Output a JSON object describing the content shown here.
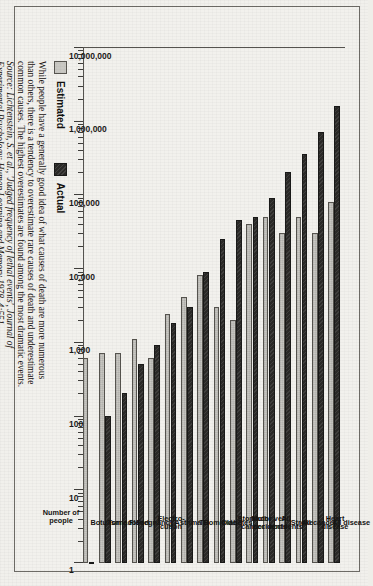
{
  "figure": {
    "legend": [
      {
        "key": "estimated",
        "label": "Estimated",
        "color": "#c9c8c3"
      },
      {
        "key": "actual",
        "label": "Actual",
        "color": "#2b2a28"
      }
    ],
    "axis_title": "Number of\npeople",
    "caption_body": "While people have a generally good idea of what causes of death are more numerous than others, there is a tendency to overestimate rare causes of death and underestimate common causes. The highest overestimates are found among the most dramatic events.",
    "caption_source": "Source: Lichtenstein, S. et al., 'Judged frequency of lethal events', Journal of Experimental Psychology: Human Learning and Memory 1978, 4:551"
  },
  "chart_data": {
    "type": "bar",
    "orientation": "horizontal",
    "title": "",
    "xlabel": "",
    "ylabel": "Number of people",
    "scale": "log10",
    "xlim": [
      1,
      10000000
    ],
    "grid": false,
    "legend_position": "bottom-left",
    "tick_labels": [
      "10,000,000",
      "1,000,000",
      "100,000",
      "10,000",
      "1,000",
      "100",
      "10",
      "1"
    ],
    "tick_values": [
      10000000,
      1000000,
      100000,
      10000,
      1000,
      100,
      10,
      1
    ],
    "categories": [
      "Botulism",
      "Tornado",
      "Flood",
      "Pregnancy",
      "Electro-\ncution",
      "Asthma",
      "TB",
      "Homicide",
      "Diabetes",
      "Stomach\ncancer",
      "Motor veh.\naccidents",
      "All\naccidents",
      "Stroke",
      "All cancer",
      "Heart\ndisease",
      "All disease"
    ],
    "series": [
      {
        "name": "Estimated",
        "values": [
          600,
          700,
          700,
          1100,
          600,
          2400,
          4000,
          8000,
          3000,
          2000,
          40000,
          50000,
          30000,
          50000,
          30000,
          80000
        ]
      },
      {
        "name": "Actual",
        "values": [
          1,
          100,
          200,
          500,
          900,
          1800,
          3000,
          9000,
          25000,
          45000,
          50000,
          90000,
          200000,
          350000,
          700000,
          1600000
        ]
      }
    ]
  }
}
